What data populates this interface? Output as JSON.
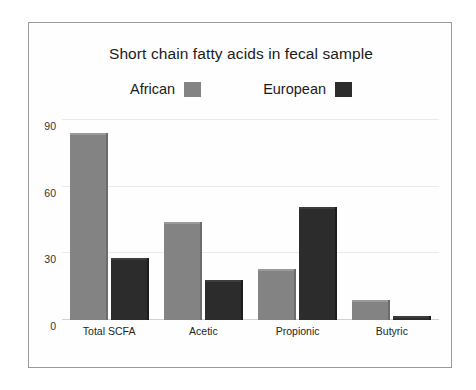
{
  "chart_data": {
    "type": "bar",
    "title": "Short chain fatty acids in fecal sample",
    "xlabel": "",
    "ylabel": "",
    "ylim": [
      0,
      90
    ],
    "yticks": [
      0,
      30,
      60,
      90
    ],
    "ytick_labels": [
      "0",
      "30",
      "60",
      "90"
    ],
    "grid": true,
    "legend_position": "top-center",
    "categories": [
      "Total SCFA",
      "Acetic",
      "Propionic",
      "Butyric"
    ],
    "series": [
      {
        "name": "African",
        "color": "#848383",
        "values": [
          84,
          44,
          23,
          9
        ]
      },
      {
        "name": "European",
        "color": "#2c2c2c",
        "values": [
          28,
          18,
          51,
          2
        ]
      }
    ]
  },
  "figure": {
    "background": "#ffffff",
    "frame_color": "#9a9a9a",
    "grid_color": "#e9e9e9",
    "axis_color": "#d2d2d2",
    "text_color": "#1b1b1b"
  }
}
